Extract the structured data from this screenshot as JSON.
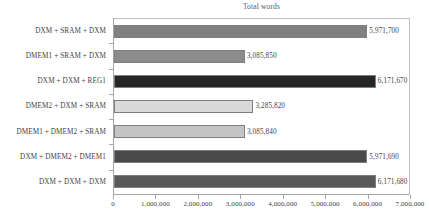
{
  "chart_data": {
    "type": "bar",
    "orientation": "horizontal",
    "title": "Total words",
    "xlabel": "",
    "ylabel": "",
    "xlim": [
      0,
      7000000
    ],
    "grid": false,
    "legend": null,
    "xticks": [
      "0",
      "1,000,000",
      "2,000,000",
      "3,000,000",
      "4,000,000",
      "5,000,000",
      "6,000,000",
      "7,000,000"
    ],
    "xtick_values": [
      0,
      1000000,
      2000000,
      3000000,
      4000000,
      5000000,
      6000000,
      7000000
    ],
    "categories": [
      "DXM + SRAM + DXM",
      "DMEM1 + SRAM + DXM",
      "DXM + DXM + REG1",
      "DMEM2 + DXM + SRAM",
      "DMEM1 + DMEM2 + SRAM",
      "DXM + DMEM2 + DMEM1",
      "DXM + DXM + DXM"
    ],
    "values": [
      5971700,
      3085850,
      6171670,
      3285820,
      3085840,
      5971690,
      6171680
    ],
    "value_labels": [
      "5,971,700",
      "3,085,850",
      "6,171,670",
      "3,285,820",
      "3,085,840",
      "5,971,690",
      "6,171,680"
    ],
    "bar_colors": [
      "#808080",
      "#8c8c8c",
      "#262626",
      "#d9d9d9",
      "#c4c4c4",
      "#4a4a4a",
      "#595959"
    ],
    "bar_border_color": "#7f7f7f",
    "axis_color": "#a6a6a6",
    "text_color": "#3f3f3f",
    "title_color": "#595959",
    "background": "#ffffff"
  }
}
